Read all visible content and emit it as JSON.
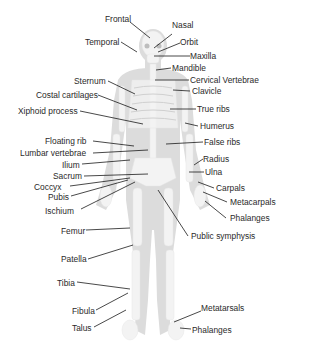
{
  "diagram": {
    "colors": {
      "body": "#d9d9d9",
      "bone": "#f2f2f2",
      "leader": "#1a1a1a",
      "text": "#2a2a2a"
    },
    "labels_left": [
      {
        "id": "frontal",
        "text": "Frontal"
      },
      {
        "id": "temporal",
        "text": "Temporal"
      },
      {
        "id": "sternum",
        "text": "Sternum"
      },
      {
        "id": "costal-cartilages",
        "text": "Costal cartilages"
      },
      {
        "id": "xiphoid-process",
        "text": "Xiphoid process"
      },
      {
        "id": "floating-rib",
        "text": "Floating rib"
      },
      {
        "id": "lumbar-vertebrae",
        "text": "Lumbar vertebrae"
      },
      {
        "id": "ilium",
        "text": "Ilium"
      },
      {
        "id": "sacrum",
        "text": "Sacrum"
      },
      {
        "id": "coccyx",
        "text": "Coccyx"
      },
      {
        "id": "pubis",
        "text": "Pubis"
      },
      {
        "id": "ischium",
        "text": "Ischium"
      },
      {
        "id": "femur",
        "text": "Femur"
      },
      {
        "id": "patella",
        "text": "Patella"
      },
      {
        "id": "tibia",
        "text": "Tibia"
      },
      {
        "id": "fibula",
        "text": "Fibula"
      },
      {
        "id": "talus",
        "text": "Talus"
      }
    ],
    "labels_right": [
      {
        "id": "nasal",
        "text": "Nasal"
      },
      {
        "id": "orbit",
        "text": "Orbit"
      },
      {
        "id": "maxilla",
        "text": "Maxilla"
      },
      {
        "id": "mandible",
        "text": "Mandible"
      },
      {
        "id": "cervical-vertebrae",
        "text": "Cervical Vertebrae"
      },
      {
        "id": "clavicle",
        "text": "Clavicle"
      },
      {
        "id": "true-ribs",
        "text": "True ribs"
      },
      {
        "id": "humerus",
        "text": "Humerus"
      },
      {
        "id": "false-ribs",
        "text": "False ribs"
      },
      {
        "id": "radius",
        "text": "Radius"
      },
      {
        "id": "ulna",
        "text": "Ulna"
      },
      {
        "id": "carpals",
        "text": "Carpals"
      },
      {
        "id": "metacarpals",
        "text": "Metacarpals"
      },
      {
        "id": "phalanges-hand",
        "text": "Phalanges"
      },
      {
        "id": "pubic-symphysis",
        "text": "Public symphysis"
      },
      {
        "id": "metatarsals",
        "text": "Metatarsals"
      },
      {
        "id": "phalanges-foot",
        "text": "Phalanges"
      }
    ]
  }
}
